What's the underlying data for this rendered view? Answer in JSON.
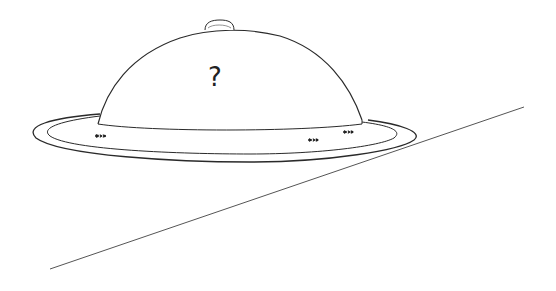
{
  "illustration": {
    "subject": "cloche-covered-platter-with-ants",
    "dome_label": "?",
    "ant_count": 3,
    "colors": {
      "background": "#ffffff",
      "stroke": "#2a2a2a",
      "table_line": "#555555"
    }
  }
}
